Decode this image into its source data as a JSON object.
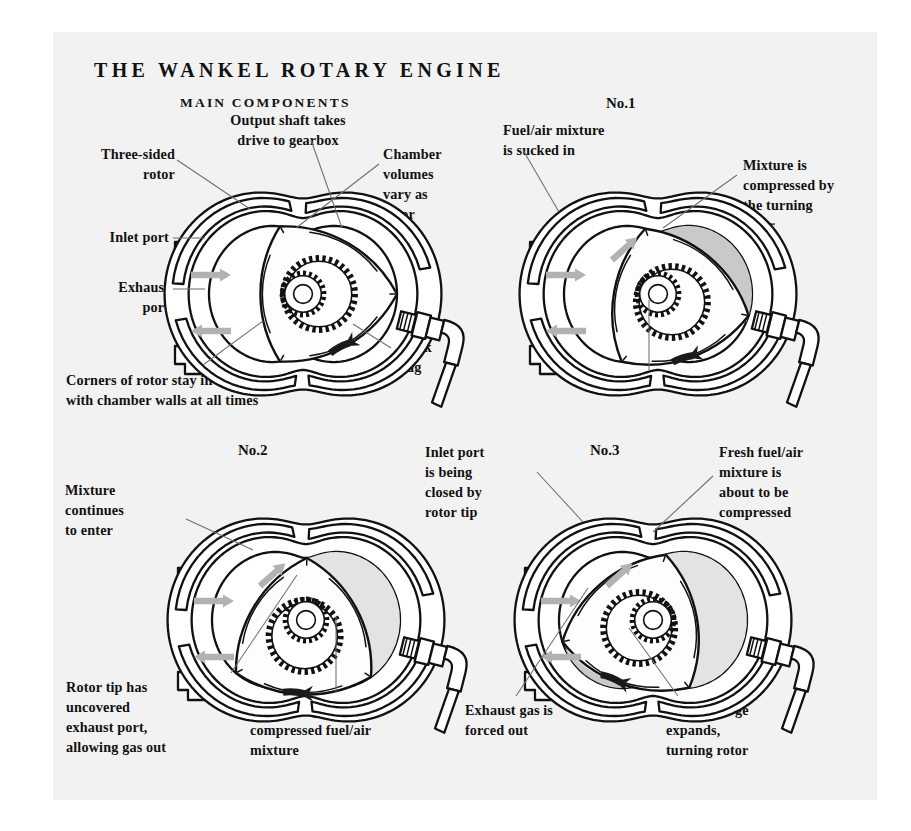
{
  "page": {
    "title": "THE WANKEL ROTARY ENGINE",
    "background": "#f2f2f2",
    "ink": "#111111",
    "lead_color": "#6e6e6e",
    "flow_arrow_color": "#b2b2b2",
    "rotation_arrow_color": "#1a1a1a",
    "shade_dark": "#c9c9c9",
    "shade_light": "#e3e3e3"
  },
  "panels": {
    "main": {
      "heading": "MAIN COMPONENTS",
      "labels": {
        "three_sided_rotor": "Three-sided\nrotor",
        "output_shaft": "Output shaft takes\ndrive to gearbox",
        "chamber_volumes": "Chamber\nvolumes\nvary as\nrotor\nturns",
        "inlet_port": "Inlet port",
        "exhaust_port": "Exhaust\nport",
        "spark_plug": "Spark\nplug",
        "corners": "Corners of rotor stay in contact\nwith chamber walls at all times"
      }
    },
    "no1": {
      "heading": "No.1",
      "labels": {
        "intake": "Fuel/air mixture\nis sucked in",
        "compression": "Mixture is\ncompressed by\nthe turning\nrotor",
        "spent": "Spent charge"
      }
    },
    "no2": {
      "heading": "No.2",
      "labels": {
        "mixture_enters": "Mixture\ncontinues\nto enter",
        "rotor_tip": "Rotor tip has\nuncovered\nexhaust port,\nallowing gas out",
        "ignition": "Spark plug ignites\ncompressed fuel/air\nmixture"
      }
    },
    "no3": {
      "heading": "No.3",
      "labels": {
        "inlet_closing": "Inlet port\nis being\nclosed by\nrotor tip",
        "fresh_charge": "Fresh fuel/air\nmixture is\nabout to be\ncompressed",
        "exhaust_out": "Exhaust gas is\nforced out",
        "burnt_expands": "Burnt charge\nexpands,\nturning rotor"
      }
    }
  },
  "engines": {
    "main": {
      "rotor_angle": 0,
      "shade_top_right": false,
      "shade_top": false,
      "shade_lower_right": false
    },
    "no1": {
      "rotor_angle": 30,
      "shade_top_right": true,
      "shade_top": false,
      "shade_lower_right": false
    },
    "no2": {
      "rotor_angle": 95,
      "shade_top_right": false,
      "shade_top": true,
      "shade_lower_right": false
    },
    "no3": {
      "rotor_angle": 150,
      "shade_top_right": false,
      "shade_top": true,
      "shade_lower_right": true
    }
  }
}
